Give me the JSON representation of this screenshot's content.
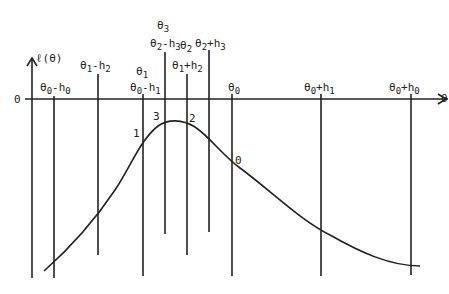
{
  "diagram": {
    "y_axis_label": "ℓ(θ)",
    "x_axis_label": "θ",
    "origin_label": "0",
    "vertical_line_labels": [
      {
        "id": "t0-h0",
        "base": "θ",
        "sub": "0",
        "rest": "-h",
        "sub2": "0"
      },
      {
        "id": "t1-h2",
        "base": "θ",
        "sub": "1",
        "rest": "-h",
        "sub2": "2"
      },
      {
        "id": "t1",
        "base": "θ",
        "sub": "1",
        "rest": "",
        "sub2": ""
      },
      {
        "id": "t0-h1",
        "base": "θ",
        "sub": "0",
        "rest": "-h",
        "sub2": "1"
      },
      {
        "id": "t3",
        "base": "θ",
        "sub": "3",
        "rest": "",
        "sub2": ""
      },
      {
        "id": "t2-h3",
        "base": "θ",
        "sub": "2",
        "rest": "-h",
        "sub2": "3"
      },
      {
        "id": "t1+h2",
        "base": "θ",
        "sub": "1",
        "rest": "+h",
        "sub2": "2"
      },
      {
        "id": "t2",
        "base": "θ",
        "sub": "2",
        "rest": "",
        "sub2": ""
      },
      {
        "id": "t2+h3",
        "base": "θ",
        "sub": "2",
        "rest": "+h",
        "sub2": "3"
      },
      {
        "id": "t0",
        "base": "θ",
        "sub": "0",
        "rest": "",
        "sub2": ""
      },
      {
        "id": "t0+h1",
        "base": "θ",
        "sub": "0",
        "rest": "+h",
        "sub2": "1"
      },
      {
        "id": "t0+h0",
        "base": "θ",
        "sub": "0",
        "rest": "+h",
        "sub2": "0"
      }
    ],
    "curve_point_labels": [
      "1",
      "3",
      "2",
      "0"
    ]
  }
}
